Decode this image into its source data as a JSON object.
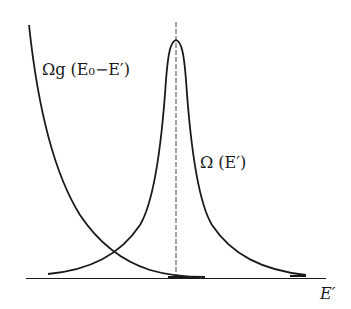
{
  "labels": {
    "omega_g": "Ωg (E₀−E′)",
    "omega": "Ω (E′)",
    "x_axis": "E′"
  },
  "curves": [
    {
      "name": "Ωg(E0-E')",
      "shape": "decreasing, crosses near axis at right"
    },
    {
      "name": "Ω(E')",
      "shape": "sharp peak (Lorentzian-like) centered at dashed line"
    }
  ],
  "colors": {
    "ink": "#1a1a1a",
    "background": "#ffffff"
  }
}
